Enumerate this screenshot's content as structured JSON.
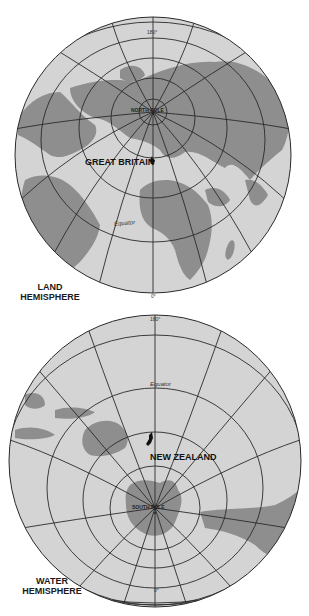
{
  "colors": {
    "ocean": "#d4d4d4",
    "land": "#8e8e8e",
    "grid": "#2a2a2a",
    "highlight": "#111111",
    "background": "#ffffff"
  },
  "land_hemisphere": {
    "title_line1": "LAND",
    "title_line2": "HEMISPHERE",
    "pole_label": "NORTH POLE",
    "top_meridian": "180°",
    "bottom_meridian": "0°",
    "equator_label": "Equator",
    "highlight_label": "GREAT BRITAIN"
  },
  "water_hemisphere": {
    "title_line1": "WATER",
    "title_line2": "HEMISPHERE",
    "pole_label": "SOUTH POLE",
    "top_meridian": "180°",
    "bottom_meridian": "0°",
    "equator_label": "Equator",
    "highlight_label": "NEW ZEALAND"
  }
}
